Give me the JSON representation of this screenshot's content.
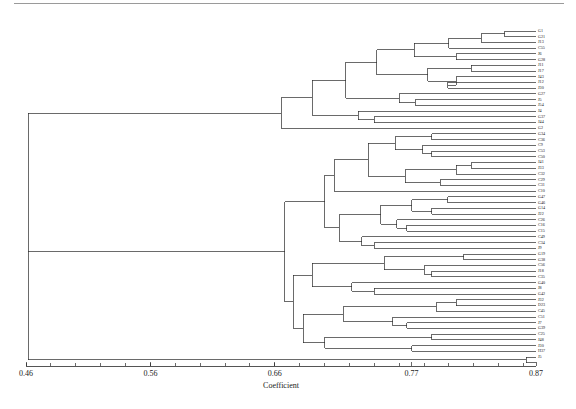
{
  "chart_data": {
    "type": "dendrogram",
    "title": "",
    "xlabel": "Coefficient",
    "ylabel": "",
    "xlim": [
      0.46,
      0.87
    ],
    "grid": false,
    "legend": null,
    "orientation": "horizontal-right",
    "tick_labels": [
      "0.46",
      "0.56",
      "0.66",
      "0.77",
      "0.87"
    ],
    "tick_values": [
      0.46,
      0.56,
      0.66,
      0.77,
      0.87
    ],
    "minor_tick_step": 0.02,
    "n_leaves": 58,
    "leaves": [
      {
        "label": "G1",
        "merge": 0.845
      },
      {
        "label": "G21",
        "merge": 0.845
      },
      {
        "label": "J13",
        "merge": 0.832
      },
      {
        "label": "C55",
        "merge": 0.826
      },
      {
        "label": "J6",
        "merge": 0.806
      },
      {
        "label": "G28",
        "merge": 0.806
      },
      {
        "label": "J11",
        "merge": 0.818
      },
      {
        "label": "J17",
        "merge": 0.818
      },
      {
        "label": "J43",
        "merge": 0.806
      },
      {
        "label": "J12",
        "merge": 0.799
      },
      {
        "label": "J30",
        "merge": 0.786
      },
      {
        "label": "G27",
        "merge": 0.773
      },
      {
        "label": "J5",
        "merge": 0.76
      },
      {
        "label": "J54",
        "merge": 0.76
      },
      {
        "label": "J4",
        "merge": 0.753
      },
      {
        "label": "G37",
        "merge": 0.74
      },
      {
        "label": "J44",
        "merge": 0.727
      },
      {
        "label": "G2",
        "merge": 0.714
      },
      {
        "label": "G34",
        "merge": 0.806
      },
      {
        "label": "C36",
        "merge": 0.806
      },
      {
        "label": "C9",
        "merge": 0.799
      },
      {
        "label": "C53",
        "merge": 0.786
      },
      {
        "label": "C50",
        "merge": 0.786
      },
      {
        "label": "J41",
        "merge": 0.818
      },
      {
        "label": "J33",
        "merge": 0.818
      },
      {
        "label": "C32",
        "merge": 0.806
      },
      {
        "label": "C29",
        "merge": 0.793
      },
      {
        "label": "C31",
        "merge": 0.773
      },
      {
        "label": "C10",
        "merge": 0.76
      },
      {
        "label": "G47",
        "merge": 0.799
      },
      {
        "label": "G46",
        "merge": 0.799
      },
      {
        "label": "G14",
        "merge": 0.786
      },
      {
        "label": "J22",
        "merge": 0.786
      },
      {
        "label": "C26",
        "merge": 0.773
      },
      {
        "label": "C16",
        "merge": 0.766
      },
      {
        "label": "C15",
        "merge": 0.76
      },
      {
        "label": "C49",
        "merge": 0.753
      },
      {
        "label": "C34",
        "merge": 0.74
      },
      {
        "label": "J9",
        "merge": 0.727
      },
      {
        "label": "G19",
        "merge": 0.812
      },
      {
        "label": "G38",
        "merge": 0.812
      },
      {
        "label": "C56",
        "merge": 0.799
      },
      {
        "label": "J18",
        "merge": 0.786
      },
      {
        "label": "C35",
        "merge": 0.773
      },
      {
        "label": "G40",
        "merge": 0.76
      },
      {
        "label": "J8",
        "merge": 0.74
      },
      {
        "label": "G42",
        "merge": 0.806
      },
      {
        "label": "J32",
        "merge": 0.806
      },
      {
        "label": "D23",
        "merge": 0.793
      },
      {
        "label": "C45",
        "merge": 0.78
      },
      {
        "label": "C51",
        "merge": 0.766
      },
      {
        "label": "J7",
        "merge": 0.753
      },
      {
        "label": "G39",
        "merge": 0.799
      },
      {
        "label": "C25",
        "merge": 0.799
      },
      {
        "label": "J48",
        "merge": 0.786
      },
      {
        "label": "J30b",
        "merge": 0.786
      },
      {
        "label": "H37",
        "merge": 0.862
      },
      {
        "label": "J5b",
        "merge": 0.862
      }
    ]
  },
  "axis": {
    "title": "Coefficient",
    "ticks": [
      {
        "value": 0.46,
        "label": "0.46"
      },
      {
        "value": 0.56,
        "label": "0.56"
      },
      {
        "value": 0.66,
        "label": "0.66"
      },
      {
        "value": 0.77,
        "label": "0.77"
      },
      {
        "value": 0.87,
        "label": "0.87"
      }
    ]
  },
  "labels": [
    "G1",
    "G21",
    "J13",
    "C55",
    "J6",
    "G28",
    "J11",
    "J17",
    "J43",
    "J12",
    "J30",
    "G27",
    "J5",
    "J54",
    "J4",
    "G37",
    "J44",
    "G2",
    "G34",
    "C36",
    "C9",
    "C53",
    "C50",
    "J41",
    "J33",
    "C32",
    "C29",
    "C31",
    "C10",
    "G47",
    "G46",
    "G14",
    "J22",
    "C26",
    "C16",
    "C15",
    "C49",
    "C34",
    "J9",
    "G19",
    "G38",
    "C56",
    "J18",
    "C35",
    "G40",
    "J8",
    "G42",
    "J32",
    "D23",
    "C45",
    "C51",
    "J7",
    "G39",
    "C25",
    "J48",
    "J30",
    "H37",
    "J5"
  ],
  "colors": {
    "line": "#2b2b2b",
    "text": "#1a1a1a",
    "background": "#ffffff",
    "rule": "#9a9a9a"
  }
}
